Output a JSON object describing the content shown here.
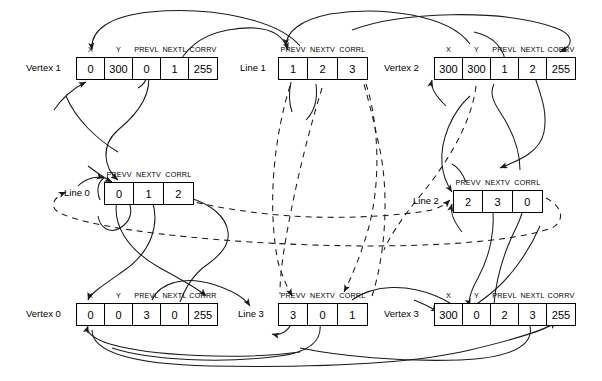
{
  "diagram": {
    "type": "linked-data-structure",
    "vertex_fields": [
      "X",
      "Y",
      "PREVL",
      "NEXTL",
      "CORRV"
    ],
    "vertex_fields_alt": [
      "X",
      "Y",
      "PREVL",
      "NEXTL",
      "CORRR"
    ],
    "line_fields": [
      "PREVV",
      "NEXTV",
      "CORRL"
    ],
    "nodes": [
      {
        "id": "vertex1",
        "label": "Vertex 1",
        "kind": "vertex",
        "headers": [
          "X",
          "Y",
          "PREVL",
          "NEXTL",
          "CORRV"
        ],
        "values": [
          "0",
          "300",
          "0",
          "1",
          "255"
        ]
      },
      {
        "id": "line1",
        "label": "Line 1",
        "kind": "line",
        "headers": [
          "PREVV",
          "NEXTV",
          "CORRL"
        ],
        "values": [
          "1",
          "2",
          "3"
        ]
      },
      {
        "id": "vertex2",
        "label": "Vertex 2",
        "kind": "vertex",
        "headers": [
          "X",
          "Y",
          "PREVL",
          "NEXTL",
          "CORRV"
        ],
        "values": [
          "300",
          "300",
          "1",
          "2",
          "255"
        ]
      },
      {
        "id": "line0",
        "label": "Line 0",
        "kind": "line",
        "headers": [
          "PREVV",
          "NEXTV",
          "CORRL"
        ],
        "values": [
          "0",
          "1",
          "2"
        ]
      },
      {
        "id": "line2",
        "label": "Line 2",
        "kind": "line",
        "headers": [
          "PREVV",
          "NEXTV",
          "CORRL"
        ],
        "values": [
          "2",
          "3",
          "0"
        ]
      },
      {
        "id": "vertex0",
        "label": "Vertex 0",
        "kind": "vertex",
        "headers": [
          "X",
          "Y",
          "PREVL",
          "NEXTL",
          "CORRR"
        ],
        "values": [
          "0",
          "0",
          "3",
          "0",
          "255"
        ]
      },
      {
        "id": "line3",
        "label": "Line 3",
        "kind": "line",
        "headers": [
          "PREVV",
          "NEXTV",
          "CORRL"
        ],
        "values": [
          "3",
          "0",
          "1"
        ]
      },
      {
        "id": "vertex3",
        "label": "Vertex 3",
        "kind": "vertex",
        "headers": [
          "X",
          "Y",
          "PREVL",
          "NEXTL",
          "CORRV"
        ],
        "values": [
          "300",
          "0",
          "2",
          "3",
          "255"
        ]
      }
    ],
    "stroke_color": "#1a1a1a",
    "text_color": "#000000",
    "background_color": "#ffffff"
  }
}
